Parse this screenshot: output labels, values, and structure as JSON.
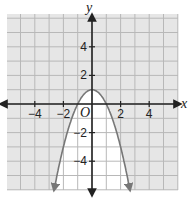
{
  "chart_data": {
    "type": "line",
    "title": "",
    "xlabel": "x",
    "ylabel": "y",
    "origin_label": "O",
    "equation": "y = -x^2 + 1",
    "xlim": [
      -6,
      6
    ],
    "ylim": [
      -6,
      6
    ],
    "grid": true,
    "x_ticks": [
      -4,
      -2,
      2,
      4
    ],
    "y_ticks": [
      4,
      2,
      -2,
      -4
    ],
    "x_tick_labels": [
      "−4",
      "−2",
      "2",
      "4"
    ],
    "y_tick_labels": [
      "4",
      "2",
      "−2",
      "−4"
    ],
    "series": [
      {
        "name": "parabola",
        "x": [
          -2.65,
          -2,
          -1,
          0,
          1,
          2,
          2.65
        ],
        "y": [
          -6,
          -3,
          0,
          1,
          0,
          -3,
          -6
        ]
      }
    ],
    "vertex": [
      0,
      1
    ],
    "x_intercepts": [
      -1,
      1
    ],
    "colors": {
      "background": "#e6e6e6",
      "grid": "#b8b8b8",
      "axes": "#222222",
      "curve": "#777777",
      "inner_region": "#ffffff"
    }
  }
}
